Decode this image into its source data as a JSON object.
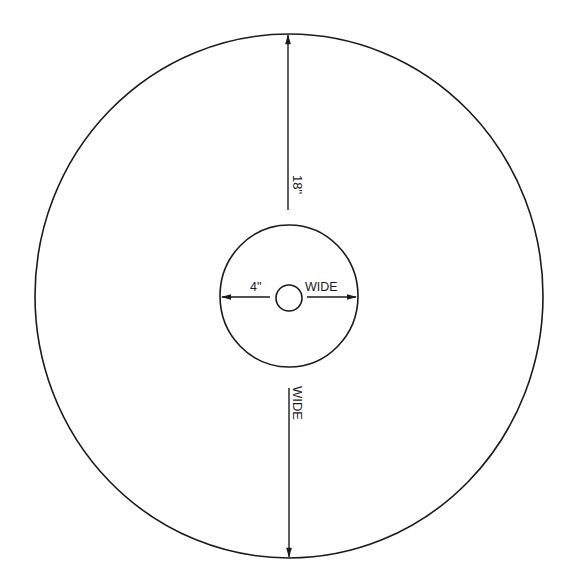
{
  "diagram": {
    "type": "disc-dimension-drawing",
    "colors": {
      "stroke": "#1a1a1a",
      "background": "#ffffff"
    },
    "outer_disc": {
      "dimension_label": "18\"",
      "dimension_label_suffix": "WIDE"
    },
    "inner_disc": {
      "dimension_label": "4\"",
      "dimension_label_suffix": "WIDE"
    },
    "center_hole": {}
  }
}
